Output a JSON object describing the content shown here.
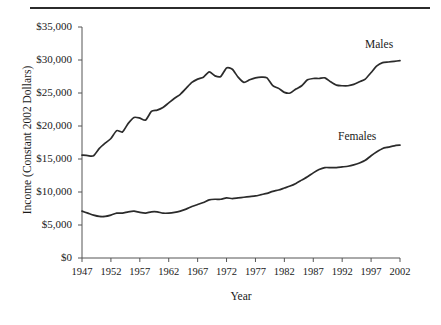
{
  "figure": {
    "top_rule": "horizontal-rule",
    "background_color": "#ffffff",
    "line_color": "#2b2b2b",
    "axis_color": "#555555"
  },
  "axes": {
    "ylabel": "Income (Constant 2002 Dollars)",
    "xlabel": "Year",
    "yticks": [
      "$0",
      "$5,000",
      "$10,000",
      "$15,000",
      "$20,000",
      "$25,000",
      "$30,000",
      "$35,000"
    ],
    "xticks": [
      "1947",
      "1952",
      "1957",
      "1962",
      "1967",
      "1972",
      "1977",
      "1982",
      "1987",
      "1992",
      "1997",
      "2002"
    ]
  },
  "annotations": {
    "males_label": "Males",
    "females_label": "Females"
  },
  "chart_data": {
    "type": "line",
    "title": "",
    "xlabel": "Year",
    "ylabel": "Income (Constant 2002 Dollars)",
    "xlim": [
      1947,
      2002
    ],
    "ylim": [
      0,
      35000
    ],
    "grid": false,
    "legend": "inline-annotations",
    "x": [
      1947,
      1948,
      1949,
      1950,
      1951,
      1952,
      1953,
      1954,
      1955,
      1956,
      1957,
      1958,
      1959,
      1960,
      1961,
      1962,
      1963,
      1964,
      1965,
      1966,
      1967,
      1968,
      1969,
      1970,
      1971,
      1972,
      1973,
      1974,
      1975,
      1976,
      1977,
      1978,
      1979,
      1980,
      1981,
      1982,
      1983,
      1984,
      1985,
      1986,
      1987,
      1988,
      1989,
      1990,
      1991,
      1992,
      1993,
      1994,
      1995,
      1996,
      1997,
      1998,
      1999,
      2000,
      2001,
      2002
    ],
    "series": [
      {
        "name": "Males",
        "values": [
          15600,
          15500,
          15500,
          16600,
          17400,
          18100,
          19300,
          19100,
          20400,
          21300,
          21200,
          20900,
          22200,
          22400,
          22800,
          23500,
          24200,
          24800,
          25700,
          26600,
          27100,
          27400,
          28200,
          27600,
          27500,
          28800,
          28600,
          27400,
          26600,
          27000,
          27300,
          27400,
          27300,
          26100,
          25700,
          25100,
          25000,
          25600,
          26100,
          27000,
          27200,
          27200,
          27300,
          26700,
          26200,
          26100,
          26100,
          26300,
          26700,
          27100,
          28100,
          29100,
          29600,
          29700,
          29800,
          29900
        ]
      },
      {
        "name": "Females",
        "values": [
          7100,
          6800,
          6500,
          6300,
          6300,
          6500,
          6800,
          6800,
          7000,
          7100,
          6900,
          6800,
          7000,
          7000,
          6800,
          6800,
          6900,
          7100,
          7400,
          7800,
          8100,
          8400,
          8800,
          8900,
          8900,
          9100,
          9000,
          9100,
          9200,
          9300,
          9400,
          9600,
          9800,
          10100,
          10300,
          10600,
          10900,
          11300,
          11800,
          12300,
          12900,
          13400,
          13700,
          13700,
          13700,
          13800,
          13900,
          14100,
          14400,
          14800,
          15500,
          16100,
          16600,
          16800,
          17000,
          17100
        ]
      }
    ]
  }
}
